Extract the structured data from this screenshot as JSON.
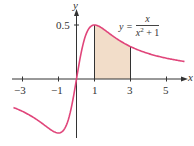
{
  "chart_data": {
    "type": "line",
    "title": "",
    "function": "y = x / (x^2 + 1)",
    "equation_label": {
      "lhs": "y =",
      "numerator": "x",
      "denominator_base": "x",
      "denominator_exp": "2",
      "denominator_rest": "+ 1"
    },
    "xlabel": "x",
    "ylabel": "y",
    "x_ticks": [
      -3,
      -1,
      1,
      3,
      5
    ],
    "x_tick_labels": [
      "−3",
      "−1",
      "1",
      "3",
      "5"
    ],
    "y_ticks": [
      0.5
    ],
    "y_tick_labels": [
      "0.5"
    ],
    "xlim": [
      -3.5,
      6
    ],
    "ylim": [
      -0.55,
      0.65
    ],
    "shaded_region": {
      "from": 1,
      "to": 3,
      "color": "#f2ddc9"
    },
    "curve_color": "#e0457a",
    "points": [
      {
        "x": -3,
        "y": -0.3
      },
      {
        "x": -2,
        "y": -0.4
      },
      {
        "x": -1,
        "y": -0.5
      },
      {
        "x": 0,
        "y": 0
      },
      {
        "x": 1,
        "y": 0.5
      },
      {
        "x": 2,
        "y": 0.4
      },
      {
        "x": 3,
        "y": 0.3
      },
      {
        "x": 4,
        "y": 0.235
      },
      {
        "x": 5,
        "y": 0.192
      },
      {
        "x": 6,
        "y": 0.162
      }
    ],
    "grid": false,
    "legend": "none"
  },
  "labels": {
    "x_axis": "x",
    "y_axis": "y",
    "tick_neg3": "−3",
    "tick_neg1": "−1",
    "tick_1": "1",
    "tick_3": "3",
    "tick_5": "5",
    "tick_y05": "0.5",
    "eq_lhs": "y =",
    "eq_num": "x",
    "eq_den_base": "x",
    "eq_den_exp": "2",
    "eq_den_rest": " + 1"
  }
}
